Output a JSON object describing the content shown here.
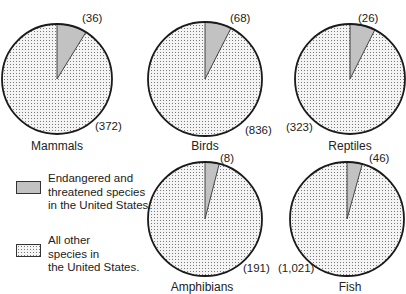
{
  "chart_data": {
    "type": "pie",
    "title": "",
    "series_names": [
      "Endangered and threatened species in the United States.",
      "All other species in the United States."
    ],
    "charts": [
      {
        "title": "Mammals",
        "labels": [
          "Endangered and threatened",
          "All other"
        ],
        "values": [
          36,
          372
        ],
        "value_labels": [
          "(36)",
          "(372)"
        ]
      },
      {
        "title": "Birds",
        "labels": [
          "Endangered and threatened",
          "All other"
        ],
        "values": [
          68,
          836
        ],
        "value_labels": [
          "(68)",
          "(836)"
        ]
      },
      {
        "title": "Reptiles",
        "labels": [
          "Endangered and threatened",
          "All other"
        ],
        "values": [
          26,
          323
        ],
        "value_labels": [
          "(26)",
          "(323)"
        ]
      },
      {
        "title": "Amphibians",
        "labels": [
          "Endangered and threatened",
          "All other"
        ],
        "values": [
          8,
          191
        ],
        "value_labels": [
          "(8)",
          "(191)"
        ]
      },
      {
        "title": "Fish",
        "labels": [
          "Endangered and threatened",
          "All other"
        ],
        "values": [
          46,
          1021
        ],
        "value_labels": [
          "(46)",
          "(1,021)"
        ]
      }
    ],
    "legend": {
      "position": "left",
      "entries": [
        {
          "lines": [
            "Endangered and",
            "threatened species",
            "in the United States."
          ],
          "fill": "gray"
        },
        {
          "lines": [
            "All other",
            "species in",
            "the United States."
          ],
          "fill": "dotted"
        }
      ]
    },
    "colors": {
      "endangered": "#c2c2c2",
      "other_bg": "#f4f4f4",
      "other_dots": "#7a7a7a",
      "outline": "#1a1a1a"
    }
  },
  "layout": {
    "pies": [
      {
        "cx": 57,
        "cy": 79,
        "r": 55,
        "title_x": 57,
        "title_y": 139,
        "small_x": 82,
        "small_y": 12,
        "big_x": 95,
        "big_y": 120
      },
      {
        "cx": 205,
        "cy": 79,
        "r": 57,
        "title_x": 205,
        "title_y": 139,
        "small_x": 230,
        "small_y": 12,
        "big_x": 245,
        "big_y": 124
      },
      {
        "cx": 350,
        "cy": 79,
        "r": 55,
        "title_x": 350,
        "title_y": 139,
        "small_x": 358,
        "small_y": 12,
        "big_x": 286,
        "big_y": 121
      },
      {
        "cx": 205,
        "cy": 219,
        "r": 57,
        "title_x": 202,
        "title_y": 280,
        "small_x": 220,
        "small_y": 152,
        "big_x": 243,
        "big_y": 262
      },
      {
        "cx": 347,
        "cy": 219,
        "r": 57,
        "title_x": 350,
        "title_y": 280,
        "small_x": 369,
        "small_y": 152,
        "big_x": 278,
        "big_y": 262
      }
    ]
  }
}
